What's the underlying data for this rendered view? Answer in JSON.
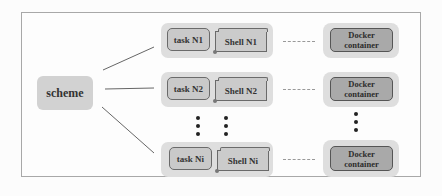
{
  "diagram": {
    "root": {
      "label": "scheme"
    },
    "rows": [
      {
        "task": "task N1",
        "shell": "Shell N1",
        "container": [
          "Docker",
          "container"
        ]
      },
      {
        "task": "task N2",
        "shell": "Shell N2",
        "container": [
          "Docker",
          "container"
        ]
      },
      {
        "task": "task Ni",
        "shell": "Shell Ni",
        "container": [
          "Docker",
          "container"
        ]
      }
    ],
    "ellipsis": "⋮",
    "edges": [
      {
        "from": "scheme",
        "to": "task N1"
      },
      {
        "from": "scheme",
        "to": "task N2"
      },
      {
        "from": "scheme",
        "to": "task Ni"
      }
    ],
    "connectors": [
      {
        "from": "Shell N1",
        "to": "Docker container",
        "style": "dashed"
      },
      {
        "from": "Shell N2",
        "to": "Docker container",
        "style": "dashed"
      },
      {
        "from": "Shell Ni",
        "to": "Docker container",
        "style": "dashed"
      }
    ],
    "colors": {
      "group_bg": "#dedede",
      "task_bg": "#c9c9c9",
      "docker_bg": "#a9a9a9",
      "scheme_bg": "#d2d2d2",
      "frame_border": "#a8a8a8"
    }
  }
}
